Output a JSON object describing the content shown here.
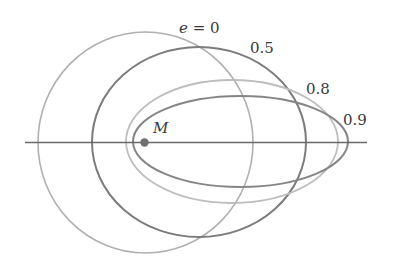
{
  "diagram": {
    "focus": {
      "label": "M",
      "cx": 144.5,
      "cy": 142.5,
      "r": 4.2,
      "color": "#707070"
    },
    "axis": {
      "x1": 25,
      "x2": 367,
      "y": 142.5,
      "color": "#6a6a6a"
    },
    "orbits": [
      {
        "eccentricity": 0,
        "label": "e = 0",
        "cx": 145.5,
        "cy": 142.5,
        "rx": 107.5,
        "ry": 110.5,
        "color": "#b0b0b0",
        "stroke_width": 1.6,
        "label_x": 179,
        "label_y": 33
      },
      {
        "eccentricity": 0.5,
        "label": "0.5",
        "cx": 199,
        "cy": 142,
        "rx": 107,
        "ry": 95,
        "color": "#7c7c7c",
        "stroke_width": 2.0,
        "label_x": 250,
        "label_y": 53
      },
      {
        "eccentricity": 0.8,
        "label": "0.8",
        "cx": 232,
        "cy": 141.5,
        "rx": 106,
        "ry": 61.5,
        "color": "#bdbdbd",
        "stroke_width": 1.8,
        "label_x": 306,
        "label_y": 94
      },
      {
        "eccentricity": 0.9,
        "label": "0.9",
        "cx": 240.5,
        "cy": 141.5,
        "rx": 107.5,
        "ry": 45.5,
        "color": "#858585",
        "stroke_width": 2.0,
        "label_x": 343,
        "label_y": 125
      }
    ]
  },
  "labels": {
    "e0": "e = 0",
    "e05": "0.5",
    "e08": "0.8",
    "e09": "0.9",
    "focus": "M"
  }
}
